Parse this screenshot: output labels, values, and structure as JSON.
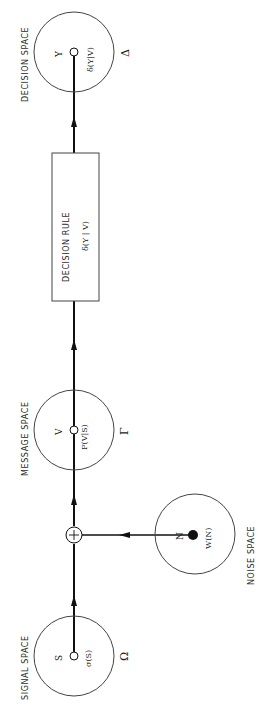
{
  "diagram": {
    "orientation": "rotated-90-ccw",
    "nodes": {
      "signal": {
        "title": "SIGNAL SPACE",
        "vector": "S",
        "density": "σ(S)",
        "space_symbol": "Ω"
      },
      "noise": {
        "title": "NOISE    SPACE",
        "vector": "N",
        "density": "W(N)"
      },
      "adder": {
        "symbol": "+"
      },
      "message": {
        "title": "MESSAGE  SPACE",
        "vector": "V",
        "density": "F(V|S)",
        "space_symbol": "Γ"
      },
      "decision_rule": {
        "title": "DECISION   RULE",
        "function": "δ(Y | V)"
      },
      "decision": {
        "title": "DECISION   SPACE",
        "vector": "Y",
        "function": "δ(Y|V)",
        "space_symbol": "Δ"
      }
    },
    "edges": [
      {
        "from": "signal",
        "to": "adder"
      },
      {
        "from": "noise",
        "to": "adder"
      },
      {
        "from": "adder",
        "to": "message"
      },
      {
        "from": "message",
        "to": "decision_rule"
      },
      {
        "from": "decision_rule",
        "to": "decision"
      }
    ],
    "colors": {
      "line": "#111111",
      "circle": "#444444",
      "background": "#ffffff"
    }
  }
}
